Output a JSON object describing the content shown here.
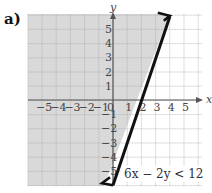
{
  "part_label": "a)",
  "chart_data": {
    "type": "line",
    "title": "6x − 2y < 12",
    "xlabel": "x",
    "ylabel": "y",
    "xlim": [
      -6,
      6
    ],
    "ylim": [
      -6,
      6
    ],
    "grid": true,
    "x_tick_labels": [
      "−5",
      "−4",
      "−3",
      "−2",
      "−1",
      "0",
      "1",
      "2",
      "3",
      "4",
      "5"
    ],
    "y_tick_labels": [
      "5",
      "4",
      "3",
      "2",
      "1",
      "−1",
      "−2",
      "−3",
      "−4",
      "−5"
    ],
    "series": [
      {
        "name": "boundary line y = 3x − 6",
        "style": "solid",
        "x": [
          -0.0,
          4.0
        ],
        "y": [
          -6,
          6
        ]
      }
    ],
    "shaded_region": "left/above boundary line (6x − 2y < 12)",
    "annotation": "6x − 2y < 12",
    "colors": {
      "shade": "#d9d9d9",
      "grid": "#a8a8a8",
      "line": "#111111",
      "axis": "#555555"
    }
  }
}
